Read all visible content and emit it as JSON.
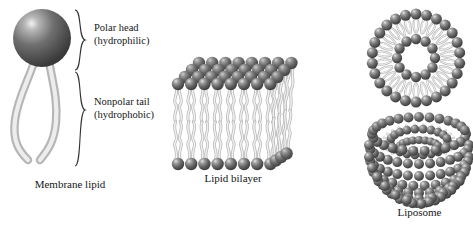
{
  "figure": {
    "background_color": "#ffffff",
    "head_color_dark": "#4a4a4a",
    "head_color_mid": "#6e6e6e",
    "head_color_light": "#d9d9d9",
    "tail_color": "#cfcfcf",
    "tail_color_edge": "#b4b4b4",
    "text_color": "#161616"
  },
  "panels": [
    {
      "id": "membrane-lipid",
      "caption": "Membrane lipid",
      "brackets": [
        {
          "id": "polar-head",
          "line1": "Polar head",
          "line2": "(hydrophilic)"
        },
        {
          "id": "nonpolar-tail",
          "line1": "Nonpolar tail",
          "line2": "(hydrophobic)"
        }
      ]
    },
    {
      "id": "lipid-bilayer",
      "caption": "Lipid bilayer",
      "top_rows": 4,
      "columns": 8,
      "leaflets": 2
    },
    {
      "id": "micelle-cross-section",
      "caption": "",
      "outer_heads": 26,
      "inner_heads": 12
    },
    {
      "id": "liposome",
      "caption": "Liposome"
    }
  ],
  "labels": {
    "polar_head_l1": "Polar head",
    "polar_head_l2": "(hydrophilic)",
    "nonpolar_tail_l1": "Nonpolar tail",
    "nonpolar_tail_l2": "(hydrophobic)",
    "membrane_lipid": "Membrane lipid",
    "lipid_bilayer": "Lipid bilayer",
    "liposome": "Liposome"
  }
}
